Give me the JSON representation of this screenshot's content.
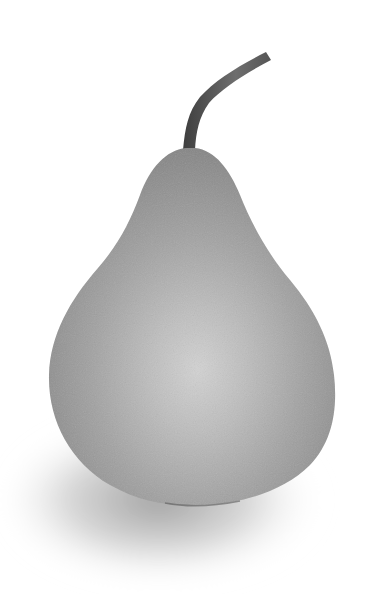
{
  "image": {
    "subject": "pear",
    "style": "grayscale photograph",
    "colors": {
      "background": "#ffffff",
      "body_dark": "#8a8a8a",
      "body_mid": "#a4a4a4",
      "highlight": "#cfcfcf",
      "stem_dark": "#4a4a4a",
      "stem_light": "#7a7a7a",
      "shadow": "#9a9a9a"
    }
  }
}
